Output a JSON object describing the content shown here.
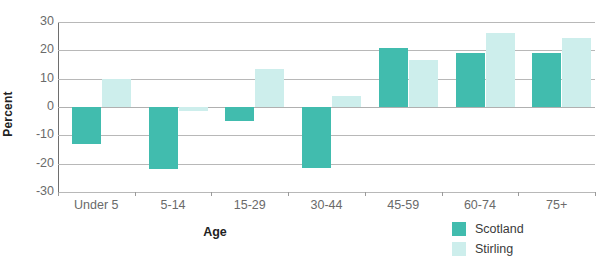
{
  "chart_data": {
    "type": "bar",
    "title": "",
    "xlabel": "Age",
    "ylabel": "Percent",
    "categories": [
      "Under 5",
      "5-14",
      "15-29",
      "30-44",
      "45-59",
      "60-74",
      "75+"
    ],
    "series": [
      {
        "name": "Scotland",
        "color": "#41bcae",
        "values": [
          -13,
          -22,
          -5,
          -21.5,
          21,
          19,
          19
        ]
      },
      {
        "name": "Stirling",
        "color": "#cdeeec",
        "values": [
          10,
          -1.5,
          13.5,
          4,
          16.5,
          26,
          24.5
        ]
      }
    ],
    "ylim": [
      -30,
      30
    ],
    "yticks": [
      30,
      20,
      10,
      0,
      -10,
      -20,
      -30
    ],
    "ytick_labels": [
      "30",
      "20",
      "10",
      "0",
      "-10",
      "-20",
      "-30"
    ],
    "grid": true,
    "legend_position": "bottom-right"
  },
  "legend": {
    "entries": [
      {
        "label": "Scotland",
        "swatch": "scotland"
      },
      {
        "label": "Stirling",
        "swatch": "stirling"
      }
    ]
  }
}
